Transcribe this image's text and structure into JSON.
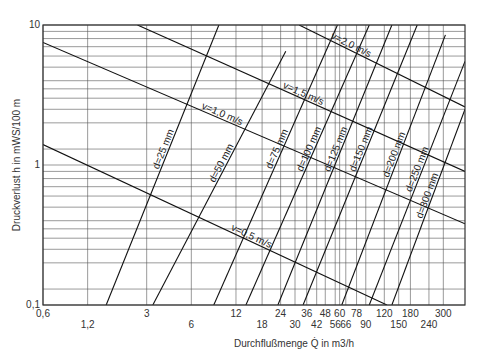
{
  "chart_data": {
    "type": "line",
    "title": "",
    "xlabel": "Durchflußmenge Q̇ in m3/h",
    "ylabel": "Druckverlust h in mWS/100 m",
    "x_scale": "log",
    "y_scale": "log",
    "xlim": [
      0.6,
      420
    ],
    "ylim": [
      0.1,
      10
    ],
    "grid": true,
    "legend": "none (inline line labels)",
    "x_ticks_row1": [
      "0,6",
      "3",
      "12",
      "24",
      "36",
      "48",
      "60",
      "78",
      "120",
      "180",
      "300"
    ],
    "x_ticks_row2": [
      "1,2",
      "6",
      "18",
      "30",
      "42",
      "56",
      "66",
      "90",
      "150",
      "240"
    ],
    "x_tick_values": [
      0.6,
      1.2,
      3,
      6,
      12,
      18,
      24,
      30,
      36,
      42,
      48,
      56,
      60,
      66,
      78,
      90,
      120,
      150,
      180,
      240,
      300
    ],
    "y_ticks": [
      "0,1",
      "1",
      "10"
    ],
    "y_grid_values": [
      0.1,
      0.13,
      0.2,
      0.25,
      0.3,
      0.35,
      0.4,
      0.5,
      0.6,
      0.7,
      0.8,
      0.9,
      1,
      1.3,
      2,
      2.5,
      3,
      3.5,
      4,
      5,
      6,
      7,
      8,
      9,
      10
    ],
    "series": [
      {
        "name": "d=25 mm",
        "kind": "diameter",
        "points": [
          [
            1.6,
            0.1
          ],
          [
            9.2,
            10
          ]
        ]
      },
      {
        "name": "d=50 mm",
        "kind": "diameter",
        "points": [
          [
            3.3,
            0.1
          ],
          [
            26,
            6.5
          ]
        ]
      },
      {
        "name": "d=75 mm",
        "kind": "diameter",
        "points": [
          [
            8.5,
            0.1
          ],
          [
            58,
            10
          ]
        ]
      },
      {
        "name": "d=100 mm",
        "kind": "diameter",
        "points": [
          [
            14,
            0.1
          ],
          [
            95,
            10
          ]
        ]
      },
      {
        "name": "d=125 mm",
        "kind": "diameter",
        "points": [
          [
            23,
            0.1
          ],
          [
            135,
            10
          ]
        ]
      },
      {
        "name": "d=150 mm",
        "kind": "diameter",
        "points": [
          [
            34,
            0.1
          ],
          [
            200,
            10
          ]
        ]
      },
      {
        "name": "d=200 mm",
        "kind": "diameter",
        "points": [
          [
            62,
            0.1
          ],
          [
            310,
            8.5
          ]
        ]
      },
      {
        "name": "d=250 mm",
        "kind": "diameter",
        "points": [
          [
            95,
            0.1
          ],
          [
            420,
            5.5
          ]
        ]
      },
      {
        "name": "d=300 mm",
        "kind": "diameter",
        "points": [
          [
            135,
            0.1
          ],
          [
            420,
            2.5
          ]
        ]
      },
      {
        "name": "v=0,5 m/s",
        "kind": "velocity",
        "points": [
          [
            0.6,
            1.4
          ],
          [
            125,
            0.1
          ]
        ]
      },
      {
        "name": "v=1,0 m/s",
        "kind": "velocity",
        "points": [
          [
            0.6,
            7.5
          ],
          [
            420,
            0.38
          ]
        ]
      },
      {
        "name": "v=1,5 m/s",
        "kind": "velocity",
        "points": [
          [
            2.6,
            10
          ],
          [
            420,
            0.9
          ]
        ]
      },
      {
        "name": "v=2,0 m/s",
        "kind": "velocity",
        "points": [
          [
            32,
            10
          ],
          [
            420,
            2.6
          ]
        ]
      }
    ]
  },
  "labels": {
    "ylabel": "Druckverlust h in mWS/100 m",
    "xlabel": "Durchflußmenge Q̇ in m3/h"
  }
}
